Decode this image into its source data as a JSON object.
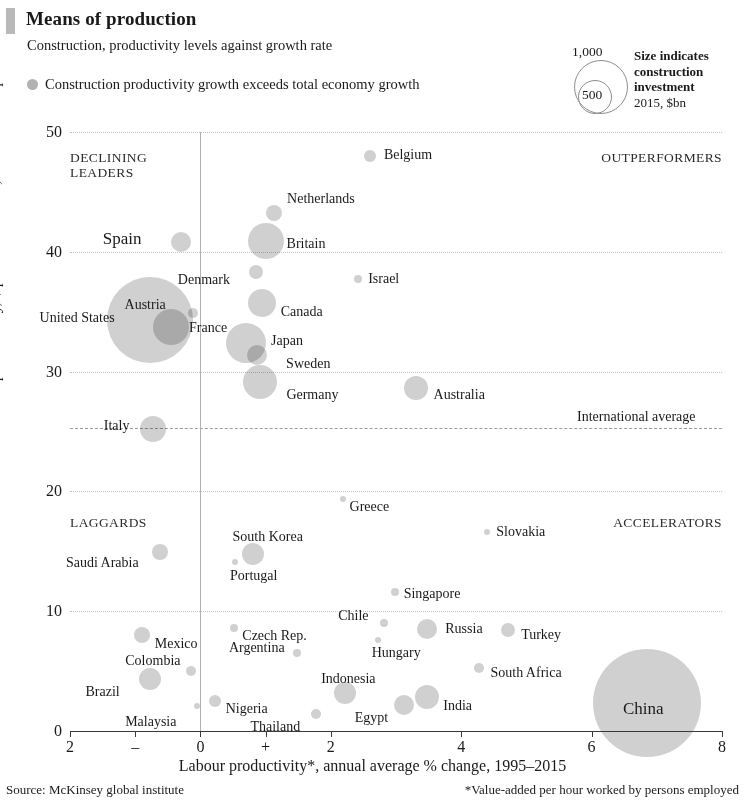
{
  "header": {
    "title": "Means of production",
    "subtitle": "Construction, productivity levels against growth rate",
    "legend_label": "Construction productivity growth exceeds total economy growth"
  },
  "size_key": {
    "outer_label": "1,000",
    "inner_label": "500",
    "line1": "Size indicates",
    "line2": "construction",
    "line3": "investment",
    "line4": "2015, $bn"
  },
  "quadrants": {
    "top_left_1": "DECLINING",
    "top_left_2": "LEADERS",
    "top_right": "OUTPERFORMERS",
    "bottom_left": "LAGGARDS",
    "bottom_right": "ACCELERATORS"
  },
  "annotations": {
    "international_average": "International average"
  },
  "footer": {
    "source": "Source: McKinsey global institute",
    "note": "*Value-added per hour worked by persons employed"
  },
  "chart_data": {
    "type": "scatter",
    "title": "Means of production",
    "subtitle": "Construction, productivity levels against growth rate",
    "xlabel": "Labour productivity*, annual average % change, 1995–2015",
    "ylabel": "Labour productivity, $ per hour worked, 2005 constant prices",
    "xlim": [
      -2,
      8
    ],
    "ylim": [
      0,
      50
    ],
    "xticks": [
      -2,
      -1,
      0,
      1,
      2,
      4,
      6,
      8
    ],
    "xticklabels": [
      "2",
      "–",
      "0",
      "+",
      "2",
      "4",
      "6",
      "8"
    ],
    "yticks": [
      0,
      10,
      20,
      30,
      40,
      50
    ],
    "yticklabels": [
      "0",
      "10",
      "20",
      "30",
      "40",
      "50"
    ],
    "grid": true,
    "legend_position": "top-left",
    "reference_lines": [
      {
        "axis": "y",
        "value": 25.3,
        "label": "International average",
        "style": "dashed"
      },
      {
        "axis": "x",
        "value": 0,
        "label": "",
        "style": "solid"
      }
    ],
    "size_encoding": {
      "field": "construction investment 2015, $bn",
      "key_values": [
        500,
        1000
      ]
    },
    "points": [
      {
        "name": "Belgium",
        "x": 2.6,
        "y": 48.0,
        "r": 6,
        "lx": 14,
        "ly": -9
      },
      {
        "name": "Netherlands",
        "x": 1.13,
        "y": 43.2,
        "r": 8,
        "lx": 13,
        "ly": -22
      },
      {
        "name": "Britain",
        "x": 1.0,
        "y": 40.9,
        "r": 18,
        "lx": 21,
        "ly": -5
      },
      {
        "name": "Spain",
        "x": -0.3,
        "y": 40.8,
        "r": 10,
        "lx": -78,
        "ly": -11,
        "big": true
      },
      {
        "name": "Denmark",
        "x": 0.85,
        "y": 38.3,
        "r": 7,
        "lx": -78,
        "ly": 0
      },
      {
        "name": "Israel",
        "x": 2.42,
        "y": 37.7,
        "r": 4,
        "lx": 10,
        "ly": -8
      },
      {
        "name": "Canada",
        "x": 0.94,
        "y": 35.7,
        "r": 14,
        "lx": 19,
        "ly": 1
      },
      {
        "name": "Austria",
        "x": -0.12,
        "y": 34.9,
        "r": 5,
        "lx": -68,
        "ly": -16
      },
      {
        "name": "United States",
        "x": -0.78,
        "y": 34.3,
        "r": 43,
        "lx": -110,
        "ly": -10
      },
      {
        "name": "France",
        "x": -0.45,
        "y": 33.7,
        "r": 18,
        "lx": 18,
        "ly": -7
      },
      {
        "name": "Japan",
        "x": 0.7,
        "y": 32.4,
        "r": 20,
        "lx": 25,
        "ly": -10
      },
      {
        "name": "Sweden",
        "x": 0.87,
        "y": 31.4,
        "r": 10,
        "lx": 29,
        "ly": 1
      },
      {
        "name": "Germany",
        "x": 0.92,
        "y": 29.1,
        "r": 17,
        "lx": 26,
        "ly": 5
      },
      {
        "name": "Australia",
        "x": 3.3,
        "y": 28.6,
        "r": 12,
        "lx": 18,
        "ly": -1
      },
      {
        "name": "Italy",
        "x": -0.73,
        "y": 25.2,
        "r": 13,
        "lx": -49,
        "ly": -11
      },
      {
        "name": "Greece",
        "x": 2.18,
        "y": 19.4,
        "r": 3,
        "lx": 7,
        "ly": 0
      },
      {
        "name": "Slovakia",
        "x": 4.4,
        "y": 16.6,
        "r": 3,
        "lx": 9,
        "ly": -8
      },
      {
        "name": "South Korea",
        "x": 0.8,
        "y": 14.8,
        "r": 11,
        "lx": -20,
        "ly": -25
      },
      {
        "name": "Saudi Arabia",
        "x": -0.62,
        "y": 14.9,
        "r": 8,
        "lx": -94,
        "ly": 3
      },
      {
        "name": "Portugal",
        "x": 0.53,
        "y": 14.1,
        "r": 3,
        "lx": -5,
        "ly": 6
      },
      {
        "name": "Singapore",
        "x": 2.98,
        "y": 11.6,
        "r": 4,
        "lx": 9,
        "ly": -6
      },
      {
        "name": "Chile",
        "x": 2.82,
        "y": 9.0,
        "r": 4,
        "lx": -46,
        "ly": -15
      },
      {
        "name": "Russia",
        "x": 3.48,
        "y": 8.5,
        "r": 10,
        "lx": 18,
        "ly": -8
      },
      {
        "name": "Turkey",
        "x": 4.72,
        "y": 8.4,
        "r": 7,
        "lx": 13,
        "ly": -3
      },
      {
        "name": "Czech Rep.",
        "x": 0.52,
        "y": 8.6,
        "r": 4,
        "lx": 8,
        "ly": 0
      },
      {
        "name": "Mexico",
        "x": -0.9,
        "y": 8.0,
        "r": 8,
        "lx": 13,
        "ly": 1
      },
      {
        "name": "Hungary",
        "x": 2.72,
        "y": 7.6,
        "r": 3,
        "lx": -6,
        "ly": 5
      },
      {
        "name": "Argentina",
        "x": 1.48,
        "y": 6.5,
        "r": 4,
        "lx": -68,
        "ly": -13
      },
      {
        "name": "Colombia",
        "x": -0.14,
        "y": 5.0,
        "r": 5,
        "lx": -66,
        "ly": -18
      },
      {
        "name": "South Africa",
        "x": 4.28,
        "y": 5.3,
        "r": 5,
        "lx": 11,
        "ly": -3
      },
      {
        "name": "Brazil",
        "x": -0.78,
        "y": 4.3,
        "r": 11,
        "lx": -64,
        "ly": 5
      },
      {
        "name": "Indonesia",
        "x": 2.22,
        "y": 3.2,
        "r": 11,
        "lx": -24,
        "ly": -22
      },
      {
        "name": "India",
        "x": 3.48,
        "y": 2.8,
        "r": 12,
        "lx": 16,
        "ly": 1
      },
      {
        "name": "China",
        "x": 6.85,
        "y": 2.3,
        "r": 54,
        "lx": -24,
        "ly": -2,
        "big": true
      },
      {
        "name": "Nigeria",
        "x": 0.22,
        "y": 2.5,
        "r": 6,
        "lx": 11,
        "ly": 0
      },
      {
        "name": "Malaysia",
        "x": -0.05,
        "y": 2.1,
        "r": 3,
        "lx": -72,
        "ly": 8
      },
      {
        "name": "Egypt",
        "x": 3.12,
        "y": 2.2,
        "r": 10,
        "lx": -49,
        "ly": 5
      },
      {
        "name": "Thailand",
        "x": 1.78,
        "y": 1.4,
        "r": 5,
        "lx": -66,
        "ly": 5
      }
    ]
  }
}
